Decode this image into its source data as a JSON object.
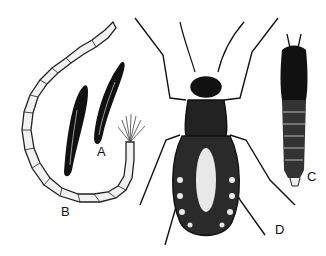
{
  "figure": {
    "type": "scientific-illustration",
    "style": "black-and-white ink drawing",
    "background": "#ffffff",
    "ink_color": "#111111"
  },
  "labels": [
    {
      "id": "A",
      "text": "A",
      "subject": "eggs",
      "x": 97,
      "y": 152
    },
    {
      "id": "B",
      "text": "B",
      "subject": "larva",
      "x": 61,
      "y": 212
    },
    {
      "id": "C",
      "text": "C",
      "subject": "pupa",
      "x": 307,
      "y": 177
    },
    {
      "id": "D",
      "text": "D",
      "subject": "adult",
      "x": 275,
      "y": 230
    }
  ]
}
